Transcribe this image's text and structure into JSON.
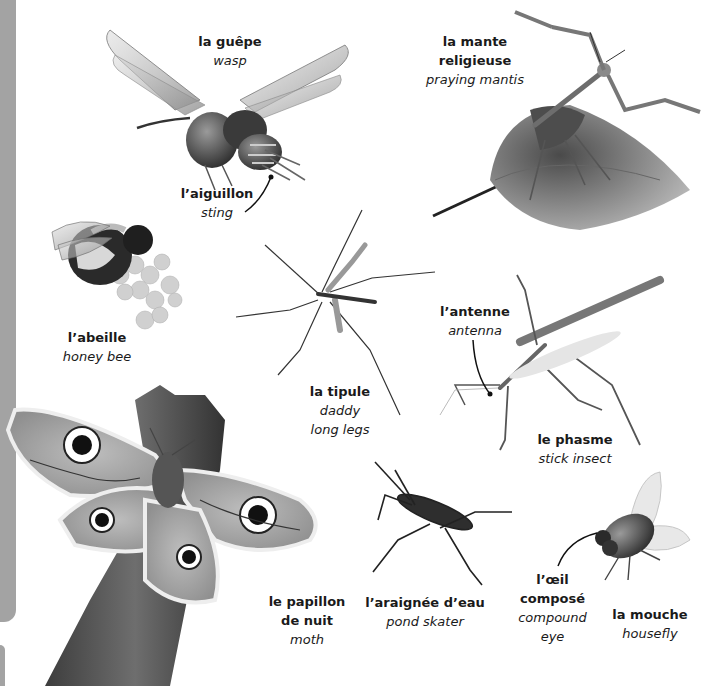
{
  "page": {
    "sidebar_color": "#a3a3a3",
    "background": "#ffffff"
  },
  "insects": {
    "wasp": {
      "fr": "la guêpe",
      "en": "wasp",
      "icon": "wasp-illustration"
    },
    "sting": {
      "fr": "l’aiguillon",
      "en": "sting",
      "icon": "leader-line"
    },
    "mantis": {
      "fr_line1": "la mante",
      "fr_line2": "religieuse",
      "en": "praying mantis",
      "icon": "mantis-on-leaf-illustration"
    },
    "bee": {
      "fr": "l’abeille",
      "en": "honey bee",
      "icon": "bee-on-flower-illustration"
    },
    "cranefly": {
      "fr": "la tipule",
      "en_line1": "daddy",
      "en_line2": "long legs",
      "icon": "cranefly-illustration"
    },
    "antenna": {
      "fr": "l’antenne",
      "en": "antenna",
      "icon": "leader-line"
    },
    "stick_insect": {
      "fr": "le phasme",
      "en": "stick insect",
      "icon": "stick-insect-illustration"
    },
    "moth": {
      "fr_line1": "le papillon",
      "fr_line2": "de nuit",
      "en": "moth",
      "icon": "moth-on-branch-illustration"
    },
    "pond_skater": {
      "fr": "l’araignée d’eau",
      "en": "pond skater",
      "icon": "pond-skater-illustration"
    },
    "compound_eye": {
      "fr_line1": "l’œil",
      "fr_line2": "composé",
      "en_line1": "compound",
      "en_line2": "eye",
      "icon": "leader-line"
    },
    "housefly": {
      "fr": "la mouche",
      "en": "housefly",
      "icon": "housefly-illustration"
    }
  }
}
